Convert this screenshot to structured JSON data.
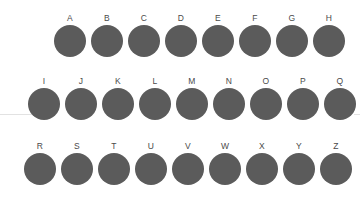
{
  "figure": {
    "background_color": "#ffffff",
    "node_color": "#5b5b5b",
    "label_color": "#4a4a4a",
    "guide_line_color": "#e2e2e2",
    "node_count": 26,
    "row_count": 3
  },
  "chart_data": {
    "type": "scatter",
    "title": "",
    "xlabel": "",
    "ylabel": "",
    "grid": false,
    "legend": null,
    "marker": "circle",
    "marker_color": "#5b5b5b",
    "categories": [
      "A",
      "B",
      "C",
      "D",
      "E",
      "F",
      "G",
      "H",
      "I",
      "J",
      "K",
      "L",
      "M",
      "N",
      "O",
      "P",
      "Q",
      "R",
      "S",
      "T",
      "U",
      "V",
      "W",
      "X",
      "Y",
      "Z"
    ],
    "rows": [
      {
        "index": 0,
        "labels": [
          "A",
          "B",
          "C",
          "D",
          "E",
          "F",
          "G",
          "H"
        ],
        "count": 8
      },
      {
        "index": 1,
        "labels": [
          "I",
          "J",
          "K",
          "L",
          "M",
          "N",
          "O",
          "P",
          "Q"
        ],
        "count": 9
      },
      {
        "index": 2,
        "labels": [
          "R",
          "S",
          "T",
          "U",
          "V",
          "W",
          "X",
          "Y",
          "Z"
        ],
        "count": 9
      }
    ]
  },
  "rows": [
    {
      "name": "row-1",
      "top": 13,
      "nodes": [
        {
          "label": "A",
          "x": 54,
          "d": 32
        },
        {
          "label": "B",
          "x": 91,
          "d": 32
        },
        {
          "label": "C",
          "x": 128,
          "d": 32
        },
        {
          "label": "D",
          "x": 165,
          "d": 32
        },
        {
          "label": "E",
          "x": 202,
          "d": 32
        },
        {
          "label": "F",
          "x": 239,
          "d": 32
        },
        {
          "label": "G",
          "x": 276,
          "d": 32
        },
        {
          "label": "H",
          "x": 313,
          "d": 32
        }
      ]
    },
    {
      "name": "row-2",
      "top": 76,
      "nodes": [
        {
          "label": "I",
          "x": 28,
          "d": 32
        },
        {
          "label": "J",
          "x": 65,
          "d": 32
        },
        {
          "label": "K",
          "x": 102,
          "d": 32
        },
        {
          "label": "L",
          "x": 139,
          "d": 32
        },
        {
          "label": "M",
          "x": 176,
          "d": 32
        },
        {
          "label": "N",
          "x": 213,
          "d": 32
        },
        {
          "label": "O",
          "x": 250,
          "d": 32
        },
        {
          "label": "P",
          "x": 287,
          "d": 32
        },
        {
          "label": "Q",
          "x": 324,
          "d": 32
        }
      ]
    },
    {
      "name": "row-3",
      "top": 141,
      "nodes": [
        {
          "label": "R",
          "x": 24,
          "d": 32
        },
        {
          "label": "S",
          "x": 61,
          "d": 32
        },
        {
          "label": "T",
          "x": 98,
          "d": 32
        },
        {
          "label": "U",
          "x": 135,
          "d": 32
        },
        {
          "label": "V",
          "x": 172,
          "d": 32
        },
        {
          "label": "W",
          "x": 209,
          "d": 32
        },
        {
          "label": "X",
          "x": 246,
          "d": 32
        },
        {
          "label": "Y",
          "x": 283,
          "d": 32
        },
        {
          "label": "Z",
          "x": 320,
          "d": 32
        }
      ]
    }
  ]
}
